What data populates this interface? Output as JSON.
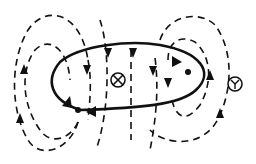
{
  "diagram": {
    "title": "",
    "stroke_color": "#111111",
    "background_color": "#ffffff",
    "elements": {
      "current_loop": {
        "type": "ellipse",
        "style": "solid",
        "current_arrows": 2
      },
      "field_lines": {
        "style": "dashed",
        "count": 8
      },
      "center_symbol": {
        "glyph": "⊗",
        "meaning": "field into page at center"
      },
      "right_symbol": {
        "glyph": "Y",
        "label": "Y"
      },
      "wire_points": {
        "count": 2
      }
    }
  }
}
